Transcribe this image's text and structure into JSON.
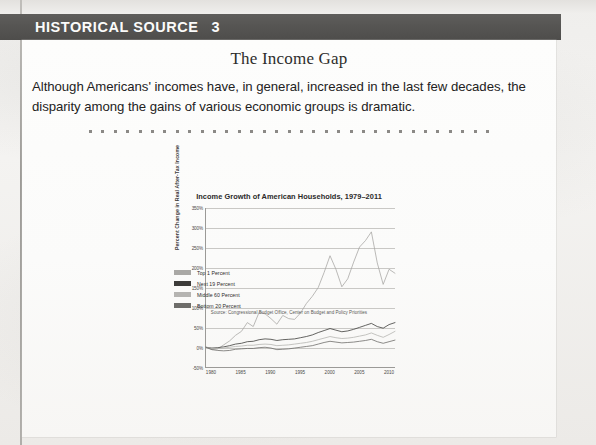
{
  "banner": {
    "title": "HISTORICAL SOURCE",
    "number": "3"
  },
  "card": {
    "title": "The Income Gap",
    "lede": "Although Americans' incomes have, in general, increased in the last few decades, the disparity among the gains of various economic groups is dramatic."
  },
  "divider": {
    "dot_count": 33
  },
  "chart_data": {
    "type": "line",
    "title": "Income Growth of American Households, 1979–2011",
    "xlabel": "",
    "ylabel": "Percent Change in Real After-Tax Income",
    "source": "Source: Congressional Budget Office, Center on Budget and Policy Priorities",
    "grid": true,
    "legend_position": "below-left",
    "xlim": [
      1979,
      2011
    ],
    "ylim": [
      -50,
      350
    ],
    "ytick_labels": [
      "350%",
      "300%",
      "250%",
      "200%",
      "150%",
      "100%",
      "50%",
      "0%",
      "-50%"
    ],
    "ytick_values": [
      350,
      300,
      250,
      200,
      150,
      100,
      50,
      0,
      -50
    ],
    "xtick_labels": [
      "1980",
      "1985",
      "1990",
      "1995",
      "2000",
      "2005",
      "2010"
    ],
    "xtick_values": [
      1980,
      1985,
      1990,
      1995,
      2000,
      2005,
      2010
    ],
    "x": [
      1979,
      1980,
      1981,
      1982,
      1983,
      1984,
      1985,
      1986,
      1987,
      1988,
      1989,
      1990,
      1991,
      1992,
      1993,
      1994,
      1995,
      1996,
      1997,
      1998,
      1999,
      2000,
      2001,
      2002,
      2003,
      2004,
      2005,
      2006,
      2007,
      2008,
      2009,
      2010,
      2011
    ],
    "series": [
      {
        "name": "Top 1 Percent",
        "color": "#a9a8a5",
        "values": [
          0,
          -6,
          -4,
          6,
          16,
          30,
          40,
          62,
          52,
          88,
          84,
          72,
          58,
          80,
          72,
          70,
          86,
          110,
          128,
          150,
          188,
          230,
          196,
          152,
          172,
          214,
          252,
          268,
          290,
          212,
          158,
          196,
          186
        ]
      },
      {
        "name": "Next 19 Percent",
        "color": "#3d3c3a",
        "values": [
          0,
          -2,
          -1,
          1,
          4,
          8,
          10,
          14,
          15,
          19,
          21,
          20,
          17,
          19,
          20,
          21,
          24,
          27,
          31,
          37,
          42,
          47,
          43,
          39,
          41,
          45,
          50,
          55,
          60,
          52,
          48,
          57,
          62
        ]
      },
      {
        "name": "Middle 60 Percent",
        "color": "#b5b4b1",
        "values": [
          0,
          -3,
          -3,
          -2,
          0,
          2,
          3,
          5,
          5,
          7,
          8,
          7,
          4,
          5,
          6,
          8,
          10,
          12,
          15,
          19,
          23,
          27,
          24,
          22,
          23,
          25,
          28,
          31,
          36,
          30,
          25,
          32,
          40
        ]
      },
      {
        "name": "Bottom 20 Percent",
        "color": "#6e6d6a",
        "values": [
          0,
          -6,
          -8,
          -9,
          -8,
          -5,
          -4,
          -3,
          -3,
          -1,
          0,
          -2,
          -6,
          -5,
          -4,
          -2,
          0,
          2,
          4,
          8,
          12,
          15,
          13,
          11,
          12,
          13,
          15,
          17,
          20,
          14,
          10,
          14,
          18
        ]
      }
    ]
  }
}
